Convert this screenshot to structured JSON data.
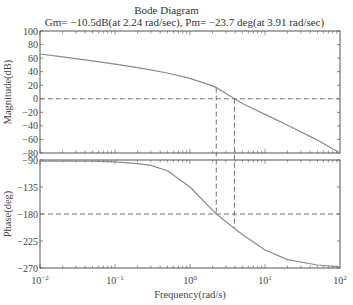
{
  "chart_data": [
    {
      "type": "line",
      "panel": "magnitude",
      "title": "Bode Diagram",
      "subtitle": "Gm= −10.5dB(at 2.24 rad/sec), Pm= −23.7 deg(at 3.91 rad/sec)",
      "xlabel": "Frequency(rad/s)",
      "ylabel": "Magnitude(dB)",
      "xscale": "log",
      "xlim": [
        0.01,
        100
      ],
      "ylim": [
        -80,
        100
      ],
      "yticks": [
        100,
        80,
        60,
        40,
        20,
        0,
        -20,
        -40,
        -60,
        -80
      ],
      "grid": false,
      "x": [
        0.01,
        0.02,
        0.05,
        0.1,
        0.2,
        0.5,
        1,
        2,
        2.24,
        3.91,
        5,
        10,
        20,
        50,
        100
      ],
      "values": [
        66,
        62,
        56,
        51,
        46,
        38,
        30,
        19,
        16.5,
        0,
        -7,
        -23,
        -39,
        -61,
        -80
      ],
      "reference_lines": {
        "horizontal": 0,
        "vertical": [
          2.24,
          3.91
        ]
      }
    },
    {
      "type": "line",
      "panel": "phase",
      "xlabel": "Frequency(rad/s)",
      "ylabel": "Phase(deg)",
      "xscale": "log",
      "xlim": [
        0.01,
        100
      ],
      "ylim": [
        -270,
        -90
      ],
      "yticks": [
        -90,
        -135,
        -180,
        -225,
        -270
      ],
      "xticks": [
        "10^-2",
        "10^-1",
        "10^0",
        "10^1",
        "10^2"
      ],
      "grid": false,
      "x": [
        0.01,
        0.05,
        0.1,
        0.2,
        0.3,
        0.5,
        1,
        2,
        2.24,
        3.91,
        5,
        10,
        20,
        50,
        100
      ],
      "values": [
        -92,
        -92,
        -93,
        -96,
        -99,
        -108,
        -135,
        -174,
        -180,
        -204,
        -214,
        -240,
        -256,
        -265,
        -268
      ],
      "reference_lines": {
        "horizontal": -180,
        "vertical": [
          2.24,
          3.91
        ]
      }
    }
  ],
  "title": "Bode Diagram",
  "subtitle": "Gm= −10.5dB(at 2.24 rad/sec), Pm= −23.7 deg(at 3.91 rad/sec)",
  "magnitude": {
    "ylabel": "Magnitude(dB)",
    "yticks": [
      "100",
      "80",
      "60",
      "40",
      "20",
      "0",
      "−20",
      "−40",
      "−60",
      "−80"
    ]
  },
  "phase": {
    "ylabel": "Phase(deg)",
    "yticks": [
      "−90",
      "−135",
      "−180",
      "−225",
      "−270"
    ]
  },
  "xaxis": {
    "label": "Frequency(rad/s)",
    "ticks": [
      {
        "base": "10",
        "exp": "−2"
      },
      {
        "base": "10",
        "exp": "−1"
      },
      {
        "base": "10",
        "exp": "0"
      },
      {
        "base": "10",
        "exp": "1"
      },
      {
        "base": "10",
        "exp": "2"
      }
    ]
  },
  "margins": {
    "gain_margin_db": -10.5,
    "gain_crossover_freq": 2.24,
    "phase_margin_deg": -23.7,
    "phase_crossover_freq": 3.91
  },
  "colors": {
    "curve": "#8a8a8a",
    "frame": "#555555",
    "dashed": "#666666"
  }
}
